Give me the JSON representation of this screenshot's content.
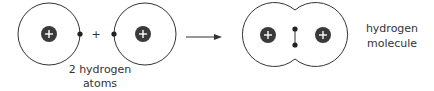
{
  "diagram": {
    "reactants": {
      "label_line1": "2 hydrogen",
      "label_line2": "atoms",
      "operator": "+"
    },
    "product": {
      "label_line1": "hydrogen",
      "label_line2": "molecule"
    },
    "colors": {
      "line": "#333333",
      "nucleus": "#3a3a3a",
      "electron": "#222222",
      "background": "#ffffff"
    }
  }
}
